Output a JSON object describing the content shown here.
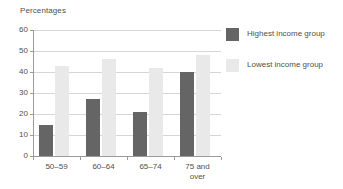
{
  "chart_data": {
    "type": "bar",
    "title": "Percentages",
    "xlabel": "",
    "ylabel": "",
    "categories": [
      "50–59",
      "60–64",
      "65–74",
      "75 and over"
    ],
    "category_lines": [
      [
        "50–59"
      ],
      [
        "60–64"
      ],
      [
        "65–74"
      ],
      [
        "75 and",
        "over"
      ]
    ],
    "series": [
      {
        "name": "Highest income group",
        "color": "#656565",
        "values": [
          15,
          27,
          21,
          40
        ]
      },
      {
        "name": "Lowest income group",
        "color": "#e9e9e9",
        "values": [
          43,
          46,
          42,
          48
        ]
      }
    ],
    "ylim": [
      0,
      60
    ],
    "yticks": [
      0,
      10,
      20,
      30,
      40,
      50,
      60
    ],
    "ytick_labels": [
      "0",
      "10",
      "20",
      "30",
      "40",
      "50",
      "60"
    ],
    "grid": true,
    "legend_position": "right"
  },
  "legend": {
    "entries": [
      {
        "label": "Highest income group",
        "swatch": "highest-income-swatch"
      },
      {
        "label": "Lowest income group",
        "swatch": "lowest-income-swatch"
      }
    ]
  }
}
